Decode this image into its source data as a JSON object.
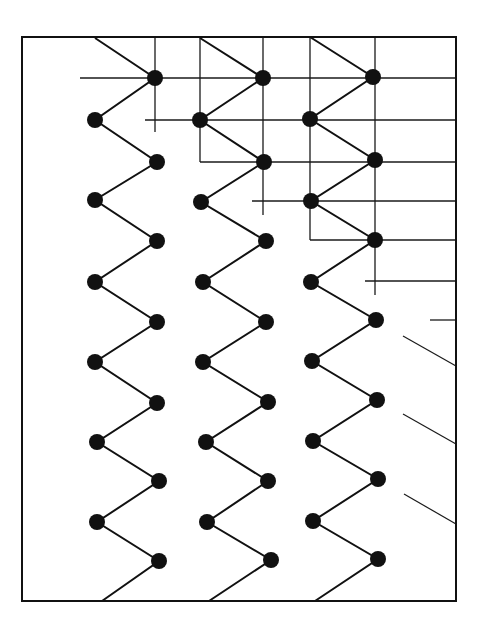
{
  "diagram": {
    "frame": {
      "x1": 22,
      "y1": 37,
      "x2": 456,
      "y2": 601,
      "stroke": "#111111"
    },
    "node_color": "#111111",
    "node_radius": 8,
    "chains": [
      {
        "name": "chain-1",
        "left_x": 95,
        "right_x": 157,
        "nodes": [
          [
            155,
            78
          ],
          [
            95,
            120
          ],
          [
            157,
            162
          ],
          [
            95,
            200
          ],
          [
            157,
            241
          ],
          [
            95,
            282
          ],
          [
            157,
            322
          ],
          [
            95,
            362
          ],
          [
            157,
            403
          ],
          [
            97,
            442
          ],
          [
            159,
            481
          ],
          [
            97,
            522
          ],
          [
            159,
            561
          ]
        ],
        "top_entry": [
          95,
          38
        ],
        "bottom_exit": [
          102,
          601
        ]
      },
      {
        "name": "chain-2",
        "left_x": 200,
        "right_x": 266,
        "nodes": [
          [
            263,
            78
          ],
          [
            200,
            120
          ],
          [
            264,
            162
          ],
          [
            201,
            202
          ],
          [
            266,
            241
          ],
          [
            203,
            282
          ],
          [
            266,
            322
          ],
          [
            203,
            362
          ],
          [
            268,
            402
          ],
          [
            206,
            442
          ],
          [
            268,
            481
          ],
          [
            207,
            522
          ],
          [
            271,
            560
          ]
        ],
        "top_entry": [
          200,
          38
        ],
        "bottom_exit": [
          209,
          601
        ]
      },
      {
        "name": "chain-3",
        "left_x": 310,
        "right_x": 376,
        "nodes": [
          [
            373,
            77
          ],
          [
            310,
            119
          ],
          [
            375,
            160
          ],
          [
            311,
            201
          ],
          [
            375,
            240
          ],
          [
            311,
            282
          ],
          [
            376,
            320
          ],
          [
            312,
            361
          ],
          [
            377,
            400
          ],
          [
            313,
            441
          ],
          [
            378,
            479
          ],
          [
            313,
            521
          ],
          [
            378,
            559
          ]
        ],
        "top_entry": [
          310,
          37
        ],
        "bottom_exit": [
          315,
          601
        ]
      }
    ],
    "grid": {
      "vertical_lines": [
        {
          "x": 155,
          "y1": 37,
          "y2": 132
        },
        {
          "x": 200,
          "y1": 37,
          "y2": 162
        },
        {
          "x": 263,
          "y1": 37,
          "y2": 215
        },
        {
          "x": 310,
          "y1": 37,
          "y2": 240
        },
        {
          "x": 375,
          "y1": 37,
          "y2": 295
        }
      ],
      "horizontal_lines": [
        {
          "y": 78,
          "x1": 80,
          "x2": 456
        },
        {
          "y": 120,
          "x1": 145,
          "x2": 456
        },
        {
          "y": 162,
          "x1": 200,
          "x2": 456
        },
        {
          "y": 201,
          "x1": 252,
          "x2": 456
        },
        {
          "y": 240,
          "x1": 310,
          "x2": 456
        },
        {
          "y": 281,
          "x1": 365,
          "x2": 456
        },
        {
          "y": 320,
          "x1": 430,
          "x2": 456
        }
      ]
    },
    "right_stubs": [
      {
        "x1": 403,
        "y1": 336,
        "x2": 456,
        "y2": 366
      },
      {
        "x1": 403,
        "y1": 414,
        "x2": 456,
        "y2": 444
      },
      {
        "x1": 404,
        "y1": 494,
        "x2": 456,
        "y2": 524
      }
    ]
  }
}
